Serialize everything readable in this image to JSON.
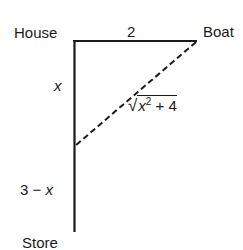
{
  "diagram": {
    "type": "right-triangle-word-problem",
    "labels": {
      "house": "House",
      "boat": "Boat",
      "store": "Store",
      "top_edge": "2",
      "upper_vertical": "x",
      "lower_vertical_num": "3",
      "lower_vertical_op": " − ",
      "lower_vertical_var": "x",
      "hypotenuse_var": "x",
      "hypotenuse_exp": "2",
      "hypotenuse_rest": " + 4",
      "hypotenuse_radical": "√"
    },
    "edges": [
      {
        "name": "house-to-boat",
        "style": "solid",
        "length_label": "2"
      },
      {
        "name": "house-to-store",
        "style": "solid",
        "length_label": "3"
      },
      {
        "name": "boat-to-shore-point",
        "style": "dashed",
        "length_label": "√(x² + 4)"
      }
    ],
    "colors": {
      "stroke": "#1a1a1a",
      "background": "#ffffff"
    }
  }
}
